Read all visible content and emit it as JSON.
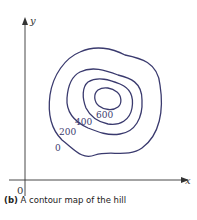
{
  "figure": {
    "axes": {
      "x_label": "x",
      "y_label": "y",
      "origin_label": "0"
    },
    "contours": [
      {
        "level": "0",
        "label": "0"
      },
      {
        "level": "200",
        "label": "200"
      },
      {
        "level": "400",
        "label": "400"
      },
      {
        "level": "600",
        "label": "600"
      }
    ],
    "line_color": "#3a3a6e",
    "caption": {
      "tag": "(b)",
      "text": " A contour map of the hill"
    }
  }
}
